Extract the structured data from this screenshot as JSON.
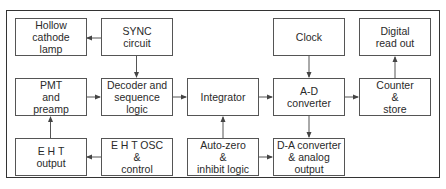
{
  "diagram": {
    "type": "block-diagram",
    "blocks": {
      "hollow_cathode_lamp": {
        "lines": [
          "Hollow",
          "cathode",
          "lamp"
        ]
      },
      "sync_circuit": {
        "lines": [
          "SYNC",
          "circuit"
        ]
      },
      "clock": {
        "lines": [
          "Clock"
        ]
      },
      "digital_read_out": {
        "lines": [
          "Digital",
          "read out"
        ]
      },
      "pmt_preamp": {
        "lines": [
          "PMT",
          "and",
          "preamp"
        ]
      },
      "decoder": {
        "lines": [
          "Decoder and",
          "sequence",
          "logic"
        ]
      },
      "integrator": {
        "lines": [
          "Integrator"
        ]
      },
      "ad_converter": {
        "lines": [
          "A-D",
          "converter"
        ]
      },
      "counter_store": {
        "lines": [
          "Counter",
          "&",
          "store"
        ]
      },
      "eht_output": {
        "lines": [
          "E H T",
          "output"
        ]
      },
      "eht_osc": {
        "lines": [
          "E H T OSC",
          "&",
          "control"
        ]
      },
      "auto_zero": {
        "lines": [
          "Auto-zero",
          "&",
          "inhibit logic"
        ]
      },
      "da_converter": {
        "lines": [
          "D-A converter",
          "& analog",
          "output"
        ]
      }
    },
    "connections": [
      {
        "from": "SYNC circuit",
        "to": "Hollow cathode lamp"
      },
      {
        "from": "SYNC circuit",
        "to": "Decoder and sequence logic"
      },
      {
        "from": "PMT and preamp",
        "to": "Decoder and sequence logic"
      },
      {
        "from": "Decoder and sequence logic",
        "to": "Integrator"
      },
      {
        "from": "Integrator",
        "to": "A-D converter"
      },
      {
        "from": "Clock",
        "to": "A-D converter"
      },
      {
        "from": "A-D converter",
        "to": "Counter & store"
      },
      {
        "from": "Counter & store",
        "to": "Digital read out"
      },
      {
        "from": "A-D converter",
        "to": "D-A converter & analog output"
      },
      {
        "from": "Auto-zero & inhibit logic",
        "to": "Integrator"
      },
      {
        "from": "Auto-zero & inhibit logic",
        "to": "D-A converter & analog output"
      },
      {
        "from": "E H T OSC & control",
        "to": "E H T output"
      },
      {
        "from": "E H T output",
        "to": "PMT and preamp"
      }
    ]
  }
}
